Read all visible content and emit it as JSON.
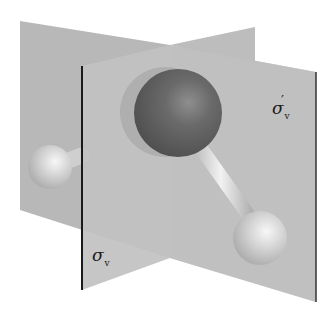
{
  "figure": {
    "molecule": {
      "central_atom": "O",
      "outer_atoms": [
        "H",
        "H"
      ]
    },
    "planes": [
      {
        "id": "sigma_v",
        "symbol": "σ",
        "subscript": "v",
        "prime": ""
      },
      {
        "id": "sigma_v_prime",
        "symbol": "σ",
        "subscript": "v",
        "prime": "′"
      }
    ],
    "colors": {
      "plane_back": "#b9b9b9",
      "plane_front": "#c4c4c4",
      "plane_shadow": "#aaaaaa",
      "plane_edge": "#1a1a1a",
      "oxygen": "#5e5e5e",
      "hydrogen": "#d6d6d6",
      "background": "#ffffff"
    }
  }
}
